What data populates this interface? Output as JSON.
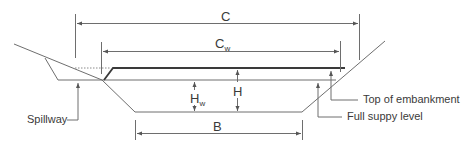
{
  "diagram": {
    "colors": {
      "line": "#6e6e6e",
      "thick_line": "#3a3a3a",
      "text": "#3a3a3a",
      "background": "#ffffff"
    },
    "dimensions": {
      "C": {
        "main": "C",
        "sub": ""
      },
      "Cw": {
        "main": "C",
        "sub": "w"
      },
      "H": {
        "main": "H",
        "sub": ""
      },
      "Hw": {
        "main": "H",
        "sub": "w"
      },
      "B": {
        "main": "B",
        "sub": ""
      }
    },
    "callouts": {
      "spillway": "Spillway",
      "top_of_embankment": "Top of embankment",
      "full_supply_level": "Full suppy level"
    }
  }
}
